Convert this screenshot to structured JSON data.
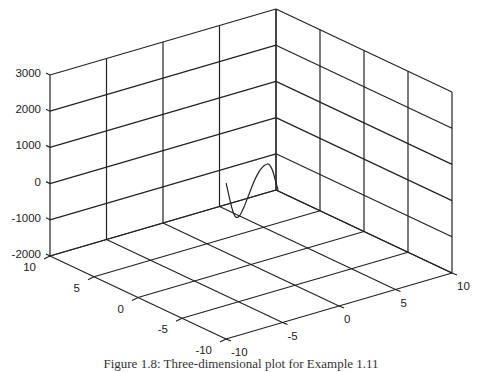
{
  "chart_data": {
    "type": "line3d",
    "title": "",
    "caption": "Figure 1.8: Three-dimensional plot for Example 1.11",
    "axes": {
      "x": {
        "label": "",
        "range": [
          -10,
          10
        ],
        "ticks": [
          10,
          5,
          0,
          -5,
          -10
        ],
        "tick_labels": [
          "10",
          "5",
          "0",
          "-5",
          "-10"
        ]
      },
      "y": {
        "label": "",
        "range": [
          -10,
          10
        ],
        "ticks": [
          -10,
          -5,
          0,
          5,
          10
        ],
        "tick_labels": [
          "-10",
          "-5",
          "0",
          "5",
          "10"
        ]
      },
      "z": {
        "label": "",
        "range": [
          -2000,
          3000
        ],
        "ticks": [
          3000,
          2000,
          1000,
          0,
          -1000,
          -2000
        ],
        "tick_labels": [
          "3000",
          "2000",
          "1000",
          "0",
          "-1000",
          "-2000"
        ]
      }
    },
    "grid": true,
    "series": [
      {
        "name": "curve",
        "points": [
          {
            "x": 0,
            "y": -2.2,
            "z": 450
          },
          {
            "x": 0,
            "y": -2.0,
            "z": 150
          },
          {
            "x": 0,
            "y": -1.8,
            "z": -150
          },
          {
            "x": 0,
            "y": -1.6,
            "z": -400
          },
          {
            "x": 0,
            "y": -1.4,
            "z": -560
          },
          {
            "x": 0,
            "y": -1.2,
            "z": -600
          },
          {
            "x": 0,
            "y": -1.0,
            "z": -560
          },
          {
            "x": 0,
            "y": -0.8,
            "z": -470
          },
          {
            "x": 0,
            "y": -0.5,
            "z": -280
          },
          {
            "x": 0,
            "y": -0.2,
            "z": -60
          },
          {
            "x": 0,
            "y": 0.1,
            "z": 160
          },
          {
            "x": 0,
            "y": 0.4,
            "z": 350
          },
          {
            "x": 0,
            "y": 0.7,
            "z": 500
          },
          {
            "x": 0,
            "y": 1.0,
            "z": 600
          },
          {
            "x": 0,
            "y": 1.3,
            "z": 650
          },
          {
            "x": 0,
            "y": 1.6,
            "z": 640
          },
          {
            "x": 0,
            "y": 1.9,
            "z": 450
          },
          {
            "x": 0,
            "y": 2.1,
            "z": 200
          },
          {
            "x": 0,
            "y": 2.3,
            "z": -50
          },
          {
            "x": 0,
            "y": 2.4,
            "z": -160
          }
        ]
      }
    ]
  }
}
